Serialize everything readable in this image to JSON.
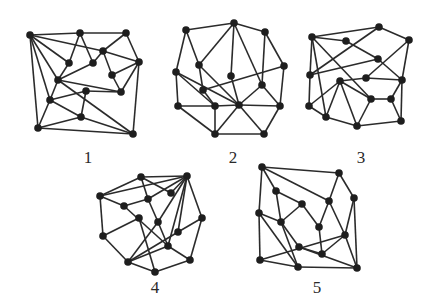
{
  "figure": {
    "colors": {
      "edge": "#2b2b2b",
      "node": "#1e1e1e",
      "background": "#ffffff"
    },
    "graphs": [
      {
        "label": "1",
        "label_pos": [
          88,
          152
        ],
        "nodes": [
          [
            30,
            35
          ],
          [
            80,
            33
          ],
          [
            126,
            33
          ],
          [
            103,
            51
          ],
          [
            139,
            62
          ],
          [
            69,
            63
          ],
          [
            93,
            63
          ],
          [
            112,
            75
          ],
          [
            58,
            80
          ],
          [
            86,
            91
          ],
          [
            121,
            92
          ],
          [
            50,
            100
          ],
          [
            81,
            117
          ],
          [
            38,
            128
          ],
          [
            133,
            134
          ]
        ],
        "edges": [
          [
            0,
            1
          ],
          [
            1,
            2
          ],
          [
            0,
            3
          ],
          [
            3,
            4
          ],
          [
            2,
            3
          ],
          [
            2,
            4
          ],
          [
            0,
            5
          ],
          [
            0,
            8
          ],
          [
            0,
            11
          ],
          [
            0,
            13
          ],
          [
            1,
            5
          ],
          [
            1,
            6
          ],
          [
            5,
            8
          ],
          [
            6,
            3
          ],
          [
            3,
            7
          ],
          [
            6,
            8
          ],
          [
            7,
            4
          ],
          [
            8,
            10
          ],
          [
            10,
            4
          ],
          [
            7,
            10
          ],
          [
            4,
            14
          ],
          [
            13,
            14
          ],
          [
            13,
            12
          ],
          [
            12,
            14
          ],
          [
            11,
            12
          ],
          [
            11,
            9
          ],
          [
            9,
            10
          ],
          [
            9,
            12
          ],
          [
            8,
            14
          ],
          [
            11,
            13
          ],
          [
            8,
            11
          ]
        ]
      },
      {
        "label": "2",
        "label_pos": [
          233,
          152
        ],
        "nodes": [
          [
            186,
            30
          ],
          [
            234,
            23
          ],
          [
            265,
            32
          ],
          [
            284,
            66
          ],
          [
            199,
            65
          ],
          [
            176,
            72
          ],
          [
            231,
            76
          ],
          [
            262,
            85
          ],
          [
            203,
            90
          ],
          [
            178,
            106
          ],
          [
            215,
            106
          ],
          [
            239,
            105
          ],
          [
            280,
            106
          ],
          [
            215,
            134
          ],
          [
            264,
            134
          ]
        ],
        "edges": [
          [
            0,
            1
          ],
          [
            1,
            2
          ],
          [
            2,
            3
          ],
          [
            2,
            7
          ],
          [
            0,
            5
          ],
          [
            0,
            4
          ],
          [
            1,
            4
          ],
          [
            1,
            6
          ],
          [
            1,
            7
          ],
          [
            4,
            8
          ],
          [
            4,
            11
          ],
          [
            5,
            9
          ],
          [
            5,
            10
          ],
          [
            5,
            11
          ],
          [
            6,
            11
          ],
          [
            8,
            3
          ],
          [
            7,
            11
          ],
          [
            7,
            12
          ],
          [
            3,
            12
          ],
          [
            9,
            10
          ],
          [
            10,
            11
          ],
          [
            11,
            12
          ],
          [
            9,
            13
          ],
          [
            10,
            13
          ],
          [
            11,
            13
          ],
          [
            11,
            14
          ],
          [
            12,
            14
          ],
          [
            13,
            14
          ],
          [
            8,
            10
          ]
        ]
      },
      {
        "label": "3",
        "label_pos": [
          361,
          152
        ],
        "nodes": [
          [
            312,
            37
          ],
          [
            346,
            41
          ],
          [
            379,
            27
          ],
          [
            409,
            40
          ],
          [
            378,
            59
          ],
          [
            310,
            75
          ],
          [
            340,
            81
          ],
          [
            366,
            78
          ],
          [
            402,
            80
          ],
          [
            371,
            99
          ],
          [
            391,
            99
          ],
          [
            309,
            106
          ],
          [
            326,
            117
          ],
          [
            357,
            126
          ],
          [
            401,
            121
          ]
        ],
        "edges": [
          [
            0,
            2
          ],
          [
            2,
            3
          ],
          [
            3,
            8
          ],
          [
            8,
            14
          ],
          [
            14,
            13
          ],
          [
            13,
            12
          ],
          [
            12,
            11
          ],
          [
            11,
            5
          ],
          [
            5,
            0
          ],
          [
            0,
            1
          ],
          [
            1,
            4
          ],
          [
            0,
            12
          ],
          [
            0,
            9
          ],
          [
            5,
            4
          ],
          [
            5,
            2
          ],
          [
            7,
            8
          ],
          [
            7,
            3
          ],
          [
            7,
            6
          ],
          [
            6,
            11
          ],
          [
            6,
            12
          ],
          [
            6,
            13
          ],
          [
            6,
            9
          ],
          [
            9,
            10
          ],
          [
            10,
            8
          ],
          [
            10,
            14
          ],
          [
            9,
            13
          ],
          [
            4,
            8
          ]
        ]
      },
      {
        "label": "4",
        "label_pos": [
          155,
          282
        ],
        "nodes": [
          [
            141,
            177
          ],
          [
            187,
            176
          ],
          [
            100,
            196
          ],
          [
            124,
            206
          ],
          [
            148,
            199
          ],
          [
            171,
            193
          ],
          [
            139,
            218
          ],
          [
            158,
            222
          ],
          [
            202,
            218
          ],
          [
            178,
            232
          ],
          [
            103,
            236
          ],
          [
            168,
            246
          ],
          [
            190,
            260
          ],
          [
            128,
            262
          ],
          [
            155,
            272
          ]
        ],
        "edges": [
          [
            0,
            1
          ],
          [
            0,
            2
          ],
          [
            0,
            5
          ],
          [
            0,
            4
          ],
          [
            2,
            1
          ],
          [
            1,
            4
          ],
          [
            1,
            5
          ],
          [
            1,
            7
          ],
          [
            1,
            9
          ],
          [
            1,
            11
          ],
          [
            1,
            8
          ],
          [
            2,
            3
          ],
          [
            2,
            10
          ],
          [
            3,
            4
          ],
          [
            3,
            11
          ],
          [
            6,
            10
          ],
          [
            6,
            14
          ],
          [
            7,
            13
          ],
          [
            7,
            11
          ],
          [
            4,
            7
          ],
          [
            8,
            9
          ],
          [
            8,
            12
          ],
          [
            9,
            13
          ],
          [
            10,
            13
          ],
          [
            13,
            14
          ],
          [
            14,
            12
          ],
          [
            13,
            11
          ],
          [
            11,
            12
          ]
        ]
      },
      {
        "label": "5",
        "label_pos": [
          317,
          282
        ],
        "nodes": [
          [
            262,
            167
          ],
          [
            339,
            173
          ],
          [
            354,
            198
          ],
          [
            276,
            191
          ],
          [
            302,
            204
          ],
          [
            329,
            201
          ],
          [
            259,
            213
          ],
          [
            281,
            222
          ],
          [
            319,
            227
          ],
          [
            345,
            235
          ],
          [
            299,
            247
          ],
          [
            322,
            254
          ],
          [
            260,
            260
          ],
          [
            298,
            267
          ],
          [
            357,
            268
          ]
        ],
        "edges": [
          [
            0,
            1
          ],
          [
            0,
            3
          ],
          [
            0,
            5
          ],
          [
            0,
            6
          ],
          [
            1,
            5
          ],
          [
            1,
            2
          ],
          [
            2,
            14
          ],
          [
            3,
            4
          ],
          [
            3,
            7
          ],
          [
            4,
            7
          ],
          [
            4,
            8
          ],
          [
            5,
            9
          ],
          [
            8,
            11
          ],
          [
            6,
            7
          ],
          [
            6,
            12
          ],
          [
            6,
            13
          ],
          [
            7,
            13
          ],
          [
            12,
            9
          ],
          [
            12,
            13
          ],
          [
            13,
            14
          ],
          [
            11,
            10
          ],
          [
            10,
            14
          ],
          [
            11,
            9
          ],
          [
            9,
            14
          ],
          [
            2,
            9
          ],
          [
            7,
            10
          ],
          [
            5,
            8
          ]
        ]
      }
    ]
  }
}
